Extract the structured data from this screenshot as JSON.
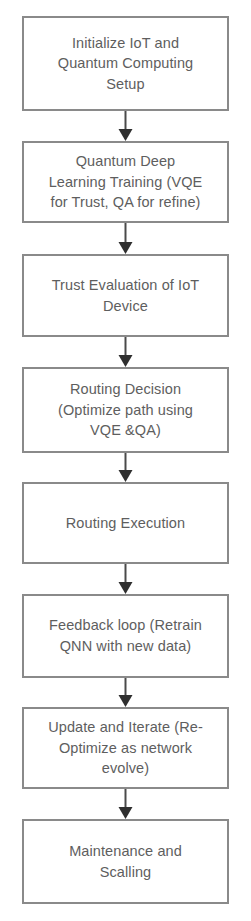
{
  "diagram": {
    "type": "flowchart",
    "orientation": "top-to-bottom",
    "colors": {
      "box_border": "#8a8a8a",
      "box_fill": "#ffffff",
      "text": "#5e5e5e",
      "arrow": "#4a4a4a",
      "background": "#ffffff"
    },
    "nodes": [
      {
        "id": "node-1",
        "name": "initialize-setup",
        "label": "Initialize IoT and\nQuantum Computing\nSetup"
      },
      {
        "id": "node-2",
        "name": "quantum-deep-learning-training",
        "label": "Quantum  Deep\nLearning Training (VQE\nfor Trust, QA for refine)"
      },
      {
        "id": "node-3",
        "name": "trust-evaluation",
        "label": "Trust Evaluation of IoT\nDevice"
      },
      {
        "id": "node-4",
        "name": "routing-decision",
        "label": "Routing Decision\n(Optimize path using\nVQE &QA)"
      },
      {
        "id": "node-5",
        "name": "routing-execution",
        "label": "Routing Execution"
      },
      {
        "id": "node-6",
        "name": "feedback-loop",
        "label": "Feedback loop (Retrain\nQNN with new data)"
      },
      {
        "id": "node-7",
        "name": "update-and-iterate",
        "label": "Update and Iterate (Re-\nOptimize as network\nevolve)"
      },
      {
        "id": "node-8",
        "name": "maintenance-and-scaling",
        "label": "Maintenance and\nScalling"
      }
    ],
    "edges": [
      {
        "id": "edge-1",
        "from": "node-1",
        "to": "node-2",
        "label": ""
      },
      {
        "id": "edge-2",
        "from": "node-2",
        "to": "node-3",
        "label": ""
      },
      {
        "id": "edge-3",
        "from": "node-3",
        "to": "node-4",
        "label": ""
      },
      {
        "id": "edge-4",
        "from": "node-4",
        "to": "node-5",
        "label": ""
      },
      {
        "id": "edge-5",
        "from": "node-5",
        "to": "node-6",
        "label": ""
      },
      {
        "id": "edge-6",
        "from": "node-6",
        "to": "node-7",
        "label": ""
      },
      {
        "id": "edge-7",
        "from": "node-7",
        "to": "node-8",
        "label": ""
      }
    ]
  }
}
